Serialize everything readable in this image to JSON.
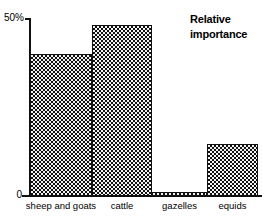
{
  "chart_data": {
    "type": "bar",
    "title": "Relative importance",
    "title_lines": [
      "Relative",
      "importance"
    ],
    "xlabel": "",
    "ylabel": "",
    "categories": [
      "sheep and goats",
      "cattle",
      "gazelles",
      "equids"
    ],
    "values": [
      40,
      48,
      1,
      14.5
    ],
    "ylim": [
      0,
      50
    ],
    "yticks": [
      0,
      50
    ],
    "ytick_labels": [
      "0",
      "50%"
    ],
    "grid": false,
    "legend": false,
    "series": [
      {
        "name": "Relative importance",
        "values": [
          40,
          48,
          1,
          14.5
        ]
      }
    ],
    "bar_fill": "checkerboard",
    "bar_edge_color": "#111111",
    "bar_fill_color": "#f2f2f2",
    "background_color": "#ffffff"
  },
  "axes": {
    "y_top_label": "50%",
    "y_bottom_label": "0"
  }
}
